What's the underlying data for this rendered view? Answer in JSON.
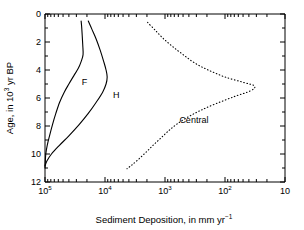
{
  "chart_data": {
    "type": "line",
    "title": "",
    "xlabel": "Sediment Deposition, in mm yr-1",
    "xlabel_parts": {
      "main": "Sediment Deposition, in mm yr",
      "sup": "−1"
    },
    "ylabel": "Age, in 103 yr BP",
    "ylabel_parts": {
      "pre": "Age, in 10",
      "sup": "3",
      "post": " yr BP"
    },
    "xscale": "log",
    "xlim": [
      100000,
      10
    ],
    "x_reversed": true,
    "ylim": [
      0,
      12
    ],
    "y_inverted": true,
    "grid": false,
    "legend": "inline-labels",
    "xticks": [
      {
        "value": 100000,
        "label_base": "10",
        "label_sup": "5"
      },
      {
        "value": 10000,
        "label_base": "10",
        "label_sup": "4"
      },
      {
        "value": 1000,
        "label_base": "10",
        "label_sup": "3"
      },
      {
        "value": 100,
        "label_base": "10",
        "label_sup": "2"
      },
      {
        "value": 10,
        "label_base": "10",
        "label_sup": ""
      }
    ],
    "yticks": [
      0,
      2,
      4,
      6,
      8,
      10,
      12
    ],
    "series": [
      {
        "name": "F",
        "style": "solid",
        "label": "F",
        "label_age": 5.1,
        "label_deposition": 22000,
        "points": [
          {
            "deposition": 25000,
            "age": 0.5
          },
          {
            "deposition": 24500,
            "age": 0.9
          },
          {
            "deposition": 24000,
            "age": 1.5
          },
          {
            "deposition": 23500,
            "age": 2.2
          },
          {
            "deposition": 23200,
            "age": 2.9
          },
          {
            "deposition": 25000,
            "age": 3.4
          },
          {
            "deposition": 28000,
            "age": 3.9
          },
          {
            "deposition": 33000,
            "age": 4.4
          },
          {
            "deposition": 40000,
            "age": 5.0
          },
          {
            "deposition": 48000,
            "age": 5.6
          },
          {
            "deposition": 57000,
            "age": 6.3
          },
          {
            "deposition": 66000,
            "age": 7.1
          },
          {
            "deposition": 75000,
            "age": 7.9
          },
          {
            "deposition": 84000,
            "age": 8.7
          },
          {
            "deposition": 92000,
            "age": 9.4
          },
          {
            "deposition": 97000,
            "age": 10.0
          },
          {
            "deposition": 99000,
            "age": 10.6
          },
          {
            "deposition": 100000,
            "age": 11.0
          }
        ]
      },
      {
        "name": "H",
        "style": "solid",
        "label": "H",
        "label_age": 6.0,
        "label_deposition": 6500,
        "points": [
          {
            "deposition": 19000,
            "age": 0.5
          },
          {
            "deposition": 16500,
            "age": 1.1
          },
          {
            "deposition": 14000,
            "age": 1.8
          },
          {
            "deposition": 12000,
            "age": 2.6
          },
          {
            "deposition": 10500,
            "age": 3.4
          },
          {
            "deposition": 9600,
            "age": 4.0
          },
          {
            "deposition": 9200,
            "age": 4.5
          },
          {
            "deposition": 9600,
            "age": 5.0
          },
          {
            "deposition": 11000,
            "age": 5.6
          },
          {
            "deposition": 14000,
            "age": 6.3
          },
          {
            "deposition": 19000,
            "age": 7.1
          },
          {
            "deposition": 27000,
            "age": 7.9
          },
          {
            "deposition": 40000,
            "age": 8.7
          },
          {
            "deposition": 58000,
            "age": 9.4
          },
          {
            "deposition": 78000,
            "age": 10.0
          },
          {
            "deposition": 93000,
            "age": 10.5
          },
          {
            "deposition": 100000,
            "age": 10.85
          }
        ]
      },
      {
        "name": "Central",
        "style": "dotted",
        "label": "Central",
        "label_age": 7.8,
        "label_deposition": 330,
        "points": [
          {
            "deposition": 1950,
            "age": 0.6
          },
          {
            "deposition": 1500,
            "age": 1.1
          },
          {
            "deposition": 1100,
            "age": 1.7
          },
          {
            "deposition": 760,
            "age": 2.3
          },
          {
            "deposition": 500,
            "age": 2.9
          },
          {
            "deposition": 320,
            "age": 3.5
          },
          {
            "deposition": 190,
            "age": 4.0
          },
          {
            "deposition": 100,
            "age": 4.5
          },
          {
            "deposition": 48,
            "age": 4.9
          },
          {
            "deposition": 32,
            "age": 5.15
          },
          {
            "deposition": 38,
            "age": 5.5
          },
          {
            "deposition": 70,
            "age": 5.9
          },
          {
            "deposition": 140,
            "age": 6.4
          },
          {
            "deposition": 260,
            "age": 6.9
          },
          {
            "deposition": 430,
            "age": 7.4
          },
          {
            "deposition": 650,
            "age": 7.9
          },
          {
            "deposition": 900,
            "age": 8.4
          },
          {
            "deposition": 1200,
            "age": 8.9
          },
          {
            "deposition": 1600,
            "age": 9.4
          },
          {
            "deposition": 2100,
            "age": 9.9
          },
          {
            "deposition": 2800,
            "age": 10.4
          },
          {
            "deposition": 3600,
            "age": 10.8
          },
          {
            "deposition": 4300,
            "age": 11.05
          }
        ]
      }
    ]
  }
}
